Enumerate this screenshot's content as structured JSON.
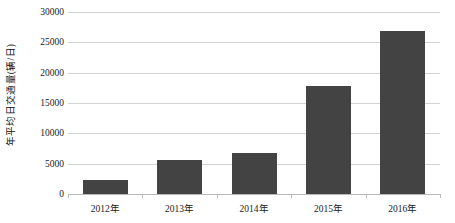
{
  "chart_data": {
    "type": "bar",
    "title": "",
    "xlabel": "",
    "ylabel": "年平均日交通量(辆/日)",
    "categories": [
      "2012年",
      "2013年",
      "2014年",
      "2015年",
      "2016年"
    ],
    "values": [
      2300,
      5600,
      6700,
      17800,
      26800
    ],
    "ylim": [
      0,
      30000
    ],
    "y_ticks": [
      0,
      5000,
      10000,
      15000,
      20000,
      25000,
      30000
    ],
    "y_tick_labels": [
      "0",
      "5000",
      "10000",
      "15000",
      "20000",
      "25000",
      "30000"
    ],
    "grid": true,
    "legend": false,
    "bar_color": "#434343",
    "gridline_color": "#d3d3d3",
    "axis_color": "#b9b9b9",
    "background_color": "#ffffff"
  }
}
